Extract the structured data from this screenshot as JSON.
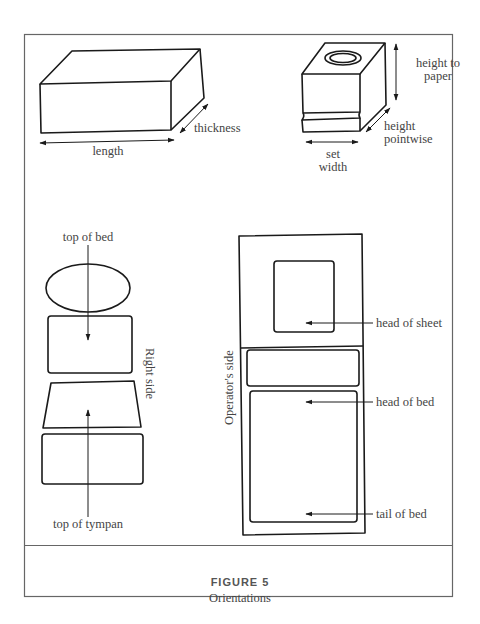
{
  "figure": {
    "number_label": "FIGURE 5",
    "title": "Orientations"
  },
  "panels": {
    "block": {
      "labels": {
        "length": "length",
        "thickness": "thickness"
      }
    },
    "type_sort": {
      "labels": {
        "height_to_paper_1": "height to",
        "height_to_paper_2": "paper",
        "height_pointwise_1": "height",
        "height_pointwise_2": "pointwise",
        "set_width_1": "set",
        "set_width_2": "width"
      }
    },
    "forme_sequence": {
      "labels": {
        "top_of_bed": "top of bed",
        "right_side": "Right side",
        "top_of_tympan": "top of tympan"
      }
    },
    "press_bed": {
      "labels": {
        "operators_side": "Operator's side",
        "head_of_sheet": "head of sheet",
        "head_of_bed": "head of bed",
        "tail_of_bed": "tail of bed"
      }
    }
  },
  "colors": {
    "line": "#1a1a1a",
    "frame": "#666666",
    "text": "#444444"
  }
}
